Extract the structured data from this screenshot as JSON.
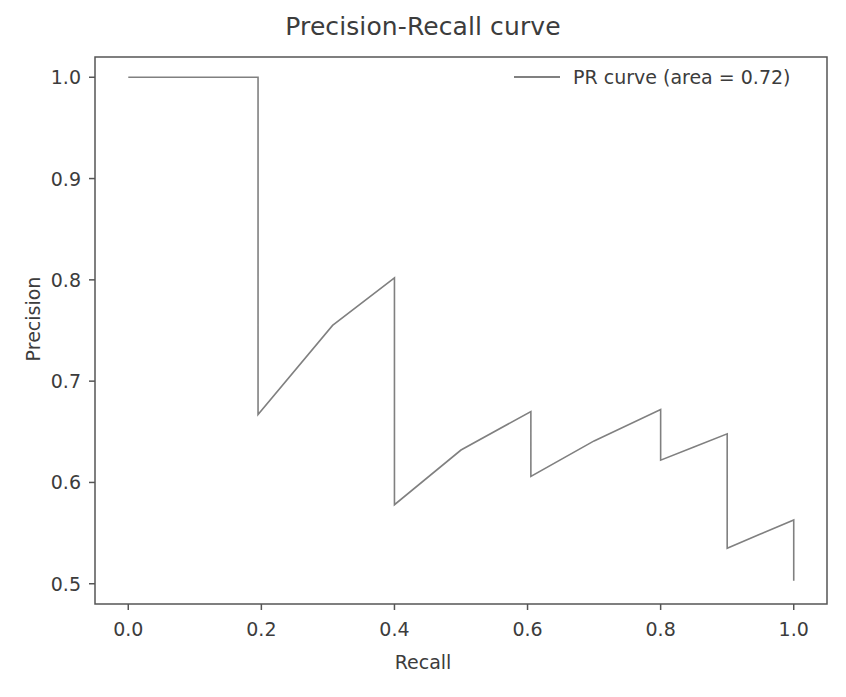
{
  "chart_data": {
    "type": "line",
    "title": "Precision-Recall curve",
    "xlabel": "Recall",
    "ylabel": "Precision",
    "xlim": [
      -0.05,
      1.05
    ],
    "ylim": [
      0.48,
      1.02
    ],
    "xticks": [
      "0.0",
      "0.2",
      "0.4",
      "0.6",
      "0.8",
      "1.0"
    ],
    "xtick_values": [
      0.0,
      0.2,
      0.4,
      0.6,
      0.8,
      1.0
    ],
    "yticks": [
      "0.5",
      "0.6",
      "0.7",
      "0.8",
      "0.9",
      "1.0"
    ],
    "ytick_values": [
      0.5,
      0.6,
      0.7,
      0.8,
      0.9,
      1.0
    ],
    "grid": false,
    "legend_position": "upper right",
    "line_color": "#808080",
    "axes_color": "#555555",
    "text_color": "#3c3c3c",
    "area_under_curve": 0.72,
    "series": [
      {
        "name": "PR curve (area = 0.72)",
        "x": [
          0.0,
          0.195,
          0.195,
          0.307,
          0.4,
          0.4,
          0.5,
          0.605,
          0.605,
          0.7,
          0.8,
          0.8,
          0.85,
          0.9,
          0.9,
          0.95,
          1.0,
          1.0
        ],
        "y": [
          1.0,
          1.0,
          0.667,
          0.755,
          0.802,
          0.578,
          0.632,
          0.67,
          0.606,
          0.641,
          0.672,
          0.622,
          0.635,
          0.648,
          0.535,
          0.549,
          0.563,
          0.503
        ]
      }
    ]
  },
  "legend": {
    "entries": [
      {
        "label": "PR curve (area = 0.72)",
        "color": "#808080"
      }
    ]
  }
}
